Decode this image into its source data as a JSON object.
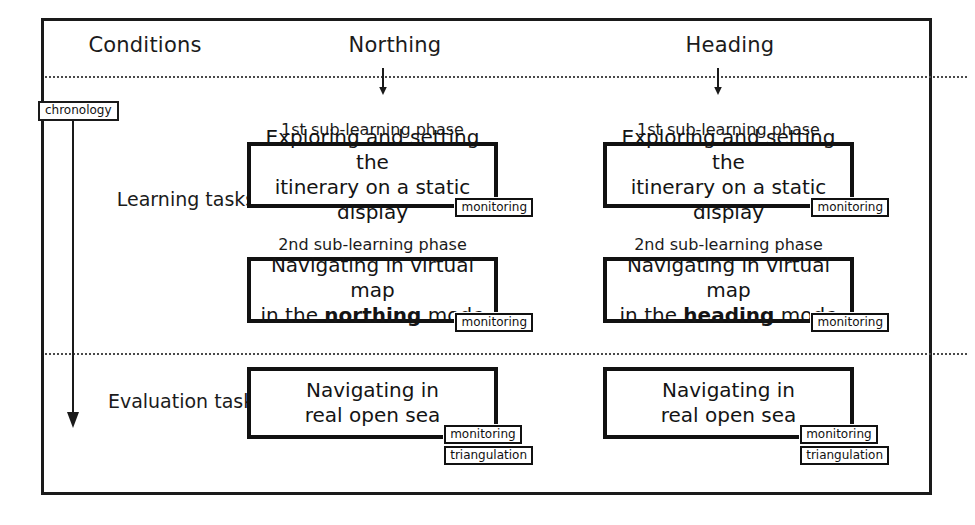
{
  "frame": {
    "accent": "#111111",
    "background": "#ffffff"
  },
  "headers": {
    "conditions": "Conditions",
    "northing": "Northing",
    "heading": "Heading"
  },
  "chronology": {
    "label": "chronology"
  },
  "rows": {
    "learning": "Learning tasks",
    "evaluation": "Evaluation tasks"
  },
  "captions": {
    "first_phase": "1st sub-learning phase",
    "second_phase": "2nd sub-learning phase"
  },
  "tags": {
    "monitoring": "monitoring",
    "triangulation": "triangulation"
  },
  "cells": {
    "northing_1": {
      "caption": "1st sub-learning phase",
      "line1": "Exploring and setting the",
      "line2": "itinerary on a static display"
    },
    "heading_1": {
      "caption": "1st sub-learning phase",
      "line1": "Exploring and setting the",
      "line2": "itinerary on a static display"
    },
    "northing_2": {
      "caption": "2nd sub-learning phase",
      "line1": "Navigating in virtual map",
      "line2_pre": "in the ",
      "line2_bold": "northing",
      "line2_post": " mode"
    },
    "heading_2": {
      "caption": "2nd sub-learning phase",
      "line1": "Navigating in virtual map",
      "line2_pre": "in the ",
      "line2_bold": "heading",
      "line2_post": " mode"
    },
    "northing_3": {
      "line1": "Navigating in",
      "line2": "real open sea"
    },
    "heading_3": {
      "line1": "Navigating in",
      "line2": "real open sea"
    }
  }
}
